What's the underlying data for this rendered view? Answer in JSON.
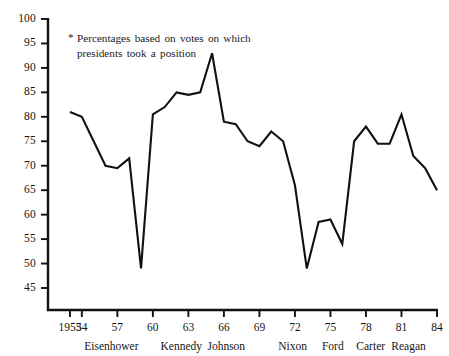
{
  "annotation": {
    "marker": "*",
    "text": "Percentages based on votes on which presidents took a position"
  },
  "axis": {
    "y_ticks": [
      "100",
      "95",
      "90",
      "85",
      "80",
      "75",
      "70",
      "65",
      "60",
      "55",
      "50",
      "45"
    ],
    "x_ticks": [
      "1953",
      "54",
      "57",
      "60",
      "63",
      "66",
      "69",
      "72",
      "75",
      "78",
      "81",
      "84"
    ],
    "presidents": [
      "Eisenhower",
      "Kennedy",
      "Johnson",
      "Nixon",
      "Ford",
      "Carter",
      "Reagan"
    ]
  },
  "chart_data": {
    "type": "line",
    "title": "",
    "subtitle": "",
    "xlabel": "",
    "ylabel": "",
    "note": "* Percentages based on votes on which presidents took a position",
    "grid": false,
    "legend": "none",
    "line_color": "#111111",
    "xlim": [
      1953,
      1984
    ],
    "ylim": [
      45,
      100
    ],
    "y_tick_values": [
      45,
      50,
      55,
      60,
      65,
      70,
      75,
      80,
      85,
      90,
      95,
      100
    ],
    "x_tick_values": [
      1953,
      1954,
      1957,
      1960,
      1963,
      1966,
      1969,
      1972,
      1975,
      1978,
      1981,
      1984
    ],
    "x_tick_labels": [
      "1953",
      "54",
      "57",
      "60",
      "63",
      "66",
      "69",
      "72",
      "75",
      "78",
      "81",
      "84"
    ],
    "president_terms": [
      {
        "name": "Eisenhower",
        "start": 1953,
        "end": 1960,
        "label_x": 1956.5
      },
      {
        "name": "Kennedy",
        "start": 1961,
        "end": 1963,
        "label_x": 1962.4
      },
      {
        "name": "Johnson",
        "start": 1964,
        "end": 1968,
        "label_x": 1966.2
      },
      {
        "name": "Nixon",
        "start": 1969,
        "end": 1974,
        "label_x": 1971.8
      },
      {
        "name": "Ford",
        "start": 1975,
        "end": 1976,
        "label_x": 1975.2
      },
      {
        "name": "Carter",
        "start": 1977,
        "end": 1980,
        "label_x": 1978.4
      },
      {
        "name": "Reagan",
        "start": 1981,
        "end": 1984,
        "label_x": 1981.6
      }
    ],
    "x": [
      1953,
      1954,
      1955,
      1956,
      1957,
      1958,
      1959,
      1960,
      1961,
      1962,
      1963,
      1964,
      1965,
      1966,
      1967,
      1968,
      1969,
      1970,
      1971,
      1972,
      1973,
      1974,
      1975,
      1976,
      1977,
      1978,
      1979,
      1980,
      1981,
      1982,
      1983,
      1984
    ],
    "values": [
      81,
      80,
      75,
      70,
      69.5,
      71.5,
      49,
      80.5,
      82,
      85,
      84.5,
      85,
      93,
      79,
      78.5,
      75,
      74,
      77,
      75,
      66,
      49,
      58.5,
      59,
      54,
      75,
      78,
      74.5,
      74.5,
      80.5,
      72,
      69.5,
      65
    ],
    "series": [
      {
        "name": "Presidential victories on congressional votes (%)",
        "values": [
          81,
          80,
          75,
          70,
          69.5,
          71.5,
          49,
          80.5,
          82,
          85,
          84.5,
          85,
          93,
          79,
          78.5,
          75,
          74,
          77,
          75,
          66,
          49,
          58.5,
          59,
          54,
          75,
          78,
          74.5,
          74.5,
          80.5,
          72,
          69.5,
          65
        ]
      }
    ]
  }
}
